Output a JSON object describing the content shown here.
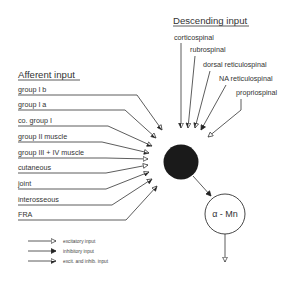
{
  "descending": {
    "header": "Descending input",
    "items": [
      {
        "label": "corticospinal",
        "arrow": "excitatory-and-inhibitory"
      },
      {
        "label": "rubrospinal",
        "arrow": "excitatory-and-inhibitory"
      },
      {
        "label": "dorsal reticulospinal",
        "arrow": "excitatory-and-inhibitory"
      },
      {
        "label": "NA reticulospinal",
        "arrow": "inhibitory"
      },
      {
        "label": "propriospinal",
        "arrow": "excitatory"
      }
    ]
  },
  "afferent": {
    "header": "Afferent input",
    "items": [
      {
        "label": "group I b",
        "arrow": "excitatory-and-inhibitory"
      },
      {
        "label": "group I a",
        "arrow": "excitatory-and-inhibitory"
      },
      {
        "label": "co. group I",
        "arrow": "excitatory-and-inhibitory"
      },
      {
        "label": "group II muscle",
        "arrow": "excitatory-and-inhibitory"
      },
      {
        "label": "group III + IV muscle",
        "arrow": "excitatory"
      },
      {
        "label": "cutaneous",
        "arrow": "excitatory"
      },
      {
        "label": "joint",
        "arrow": "excitatory-and-inhibitory"
      },
      {
        "label": "interosseous",
        "arrow": "excitatory-and-inhibitory"
      },
      {
        "label": "FRA",
        "arrow": "excitatory-and-inhibitory"
      }
    ]
  },
  "nodes": {
    "interneuron": {
      "fill": "#1a1a1a"
    },
    "motoneuron": {
      "label": "α - Mn"
    }
  },
  "legend": [
    {
      "arrow": "excitatory",
      "label": "excitatory input"
    },
    {
      "arrow": "inhibitory",
      "label": "inhibitory input"
    },
    {
      "arrow": "excitatory-and-inhibitory",
      "label": "excit. and inhib. input"
    }
  ],
  "colors": {
    "ink": "#333333",
    "background": "#ffffff"
  }
}
